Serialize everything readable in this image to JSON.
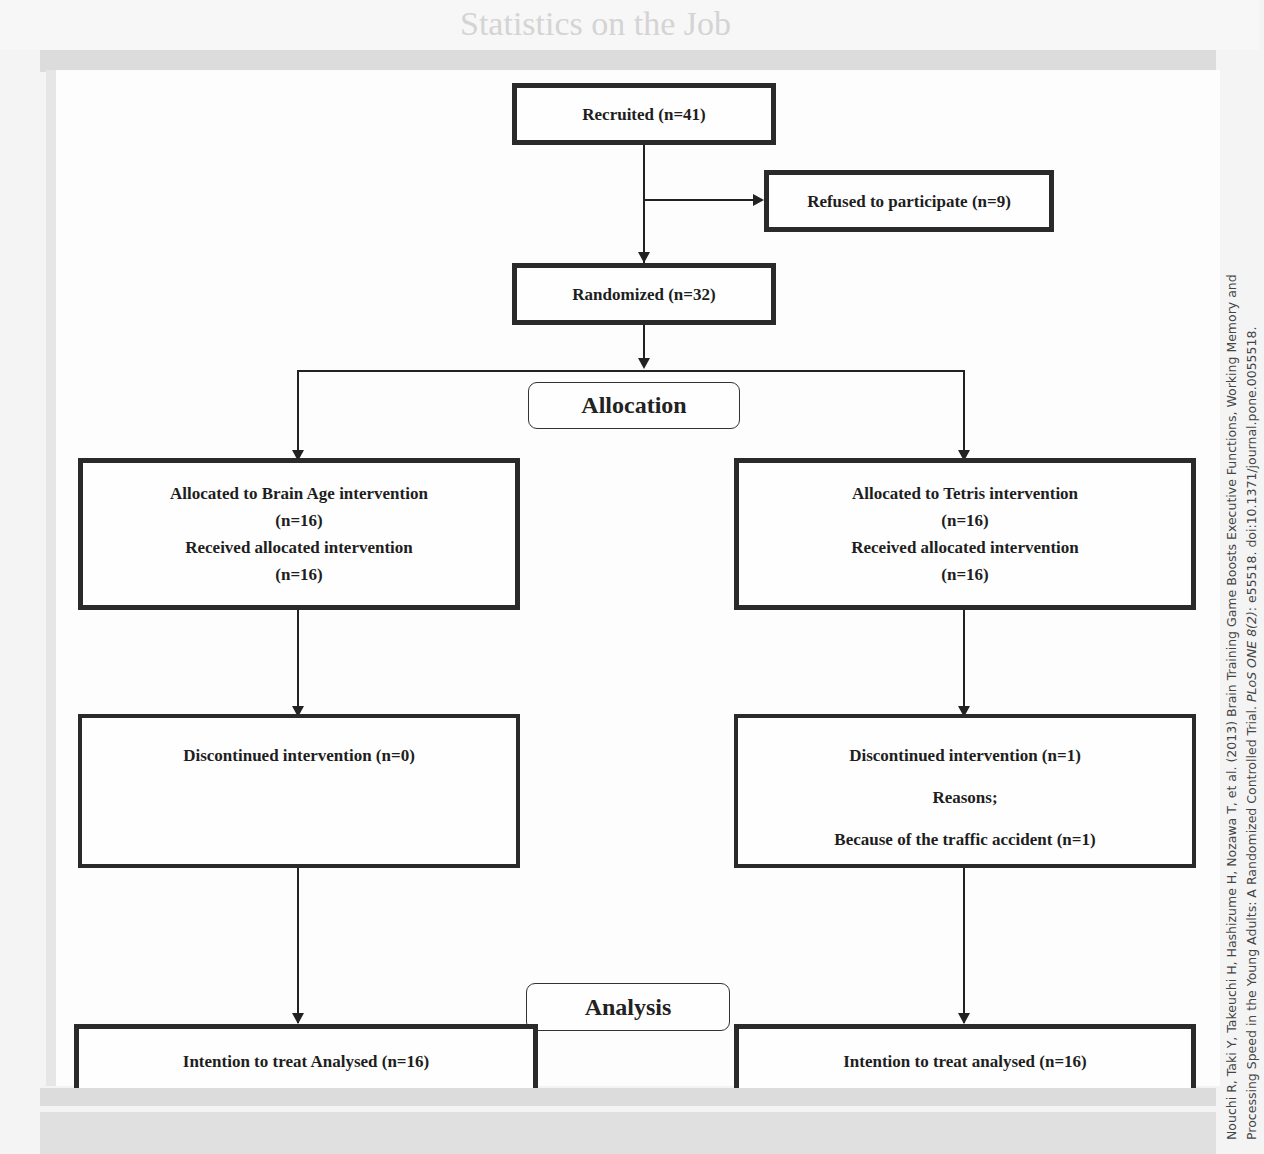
{
  "figure": {
    "type": "CONSORT flow diagram",
    "stages": {
      "allocation": "Allocation",
      "analysis": "Analysis"
    },
    "enrollment": {
      "recruited": "Recruited (n=41)",
      "refused": "Refused to participate (n=9)",
      "randomized": "Randomized (n=32)"
    },
    "arms": [
      {
        "name": "Brain Age",
        "allocated": "Allocated to Brain Age intervention",
        "allocated_n": "(n=16)",
        "received": "Received allocated intervention",
        "received_n": "(n=16)",
        "discontinued": "Discontinued intervention (n=0)",
        "analysed": "Intention to treat Analysed (n=16)"
      },
      {
        "name": "Tetris",
        "allocated": "Allocated to Tetris intervention",
        "allocated_n": "(n=16)",
        "received": "Received allocated intervention",
        "received_n": "(n=16)",
        "discontinued": "Discontinued intervention (n=1)",
        "reasons_label": "Reasons;",
        "reason_detail": "Because of the traffic accident (n=1)",
        "analysed": "Intention to treat analysed (n=16)"
      }
    ]
  },
  "citation": {
    "line1_prefix": "Nouchi R, Taki Y, Takeuchi H, Hashizume H, Nozawa T, et al. (2013) Brain Training Game Boosts Executive Functions, Working Memory and",
    "line2_prefix": "Processing Speed in the Young Adults: A Randomized Controlled Trial. ",
    "line2_journal": "PLoS ONE 8(2)",
    "line2_suffix": ": e55518. doi:10.1371/journal.pone.0055518."
  },
  "background_text": {
    "heading_fragment": "Statistics on the Job"
  }
}
